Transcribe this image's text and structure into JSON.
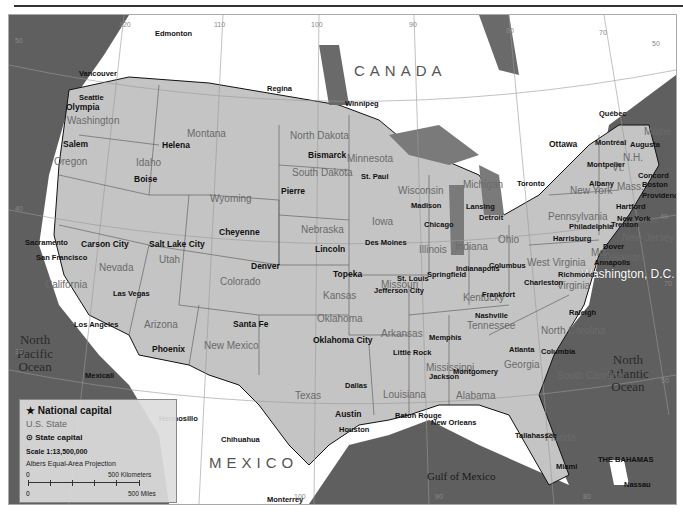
{
  "map": {
    "title_bar": "",
    "countries": {
      "canada": "CANADA",
      "mexico": "MEXICO",
      "bahamas": "THE BAHAMAS"
    },
    "oceans": {
      "pacific": "North\nPacific\nOcean",
      "atlantic": "North\nAtlantic\nOcean",
      "gulf": "Gulf of Mexico"
    },
    "national_capital": "Washington, D.C.",
    "graticule": {
      "longitudes": [
        "120",
        "110",
        "100",
        "90",
        "80",
        "70",
        "100",
        "90",
        "80"
      ],
      "latitudes": [
        "50",
        "40",
        "30",
        "50",
        "40",
        "70",
        "30",
        "50"
      ]
    },
    "states": [
      "Washington",
      "Oregon",
      "California",
      "Idaho",
      "Nevada",
      "Montana",
      "Wyoming",
      "Utah",
      "Arizona",
      "Colorado",
      "New Mexico",
      "North Dakota",
      "South Dakota",
      "Nebraska",
      "Kansas",
      "Oklahoma",
      "Texas",
      "Minnesota",
      "Iowa",
      "Missouri",
      "Arkansas",
      "Louisiana",
      "Wisconsin",
      "Illinois",
      "Michigan",
      "Indiana",
      "Ohio",
      "Kentucky",
      "Tennessee",
      "Mississippi",
      "Alabama",
      "Georgia",
      "Florida",
      "South Carolina",
      "North Carolina",
      "Virginia",
      "West Virginia",
      "Pennsylvania",
      "New York",
      "Maine",
      "Vt.",
      "N.H.",
      "Mass.",
      "Conn.",
      "New Jersey",
      "Md.",
      "Delaware",
      "R.I."
    ],
    "state_capitals": [
      "Olympia",
      "Salem",
      "Sacramento",
      "Carson City",
      "Boise",
      "Helena",
      "Cheyenne",
      "Salt Lake City",
      "Phoenix",
      "Denver",
      "Santa Fe",
      "Bismarck",
      "Pierre",
      "Lincoln",
      "Topeka",
      "Oklahoma City",
      "Austin",
      "St. Paul",
      "Des Moines",
      "Jefferson City",
      "Little Rock",
      "Baton Rouge",
      "Madison",
      "Springfield",
      "Lansing",
      "Indianapolis",
      "Columbus",
      "Frankfort",
      "Nashville",
      "Jackson",
      "Montgomery",
      "Atlanta",
      "Tallahassee",
      "Columbia",
      "Raleigh",
      "Richmond",
      "Charleston",
      "Harrisburg",
      "Albany",
      "Augusta",
      "Montpelier",
      "Concord",
      "Boston",
      "Providence",
      "Hartford",
      "Trenton",
      "Dover",
      "Annapolis"
    ],
    "cities": [
      "Edmonton",
      "Vancouver",
      "Seattle",
      "Regina",
      "Winnipeg",
      "Québec",
      "Montréal",
      "Ottawa",
      "Toronto",
      "San Francisco",
      "Las Vegas",
      "Los Angeles",
      "Mexicali",
      "Hermosillo",
      "Chihuahua",
      "Monterrey",
      "Dallas",
      "Houston",
      "New Orleans",
      "Memphis",
      "St. Louis",
      "Chicago",
      "Detroit",
      "Philadelphia",
      "New York",
      "Miami",
      "Nassau"
    ]
  },
  "legend": {
    "national_capital": "★ National capital",
    "us_state": "U.S. State",
    "state_capital": "⊙ State capital",
    "scale": "Scale 1:13,500,000",
    "projection": "Albers Equal-Area Projection",
    "km_zero": "0",
    "km_label": "500 Kilometers",
    "mi_zero": "0",
    "mi_label": "500 Miles"
  },
  "colors": {
    "land_us": "#c4c4c4",
    "land_other": "#ffffff",
    "water": "#5f5f5f",
    "border": "#111111"
  }
}
